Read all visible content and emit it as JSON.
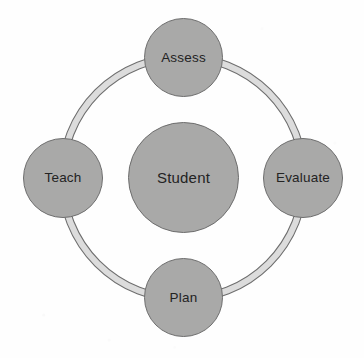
{
  "diagram": {
    "type": "cyclical ring diagram",
    "background_color": "#fefefe",
    "node_fill_color": "#a9a9a8",
    "node_border_color": "#6e6e6e",
    "ring_band_color": "#dcdcdc",
    "ring_outline_color": "#6e6e6e",
    "text_color": "#232323",
    "center": {
      "label": "Student",
      "icon": "circle-node",
      "cx": 183,
      "cy": 177,
      "diameter": 111
    },
    "ring": {
      "cx": 183,
      "cy": 178,
      "radius": 121,
      "band_thickness": 7,
      "direction": "clockwise"
    },
    "nodes": [
      {
        "id": "assess",
        "label": "Assess",
        "position": "top",
        "icon": "circle-node",
        "cx": 183,
        "cy": 57,
        "diameter": 79
      },
      {
        "id": "evaluate",
        "label": "Evaluate",
        "position": "right",
        "icon": "circle-node",
        "cx": 303,
        "cy": 178,
        "diameter": 80
      },
      {
        "id": "plan",
        "label": "Plan",
        "position": "bottom",
        "icon": "circle-node",
        "cx": 183,
        "cy": 297,
        "diameter": 79
      },
      {
        "id": "teach",
        "label": "Teach",
        "position": "left",
        "icon": "circle-node",
        "cx": 63,
        "cy": 178,
        "diameter": 80
      }
    ]
  }
}
